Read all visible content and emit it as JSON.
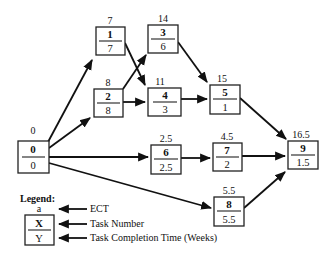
{
  "diagram": {
    "type": "activity-on-node network",
    "nodes": [
      {
        "id": "0",
        "task": "0",
        "ect": "0",
        "time": "0"
      },
      {
        "id": "1",
        "task": "1",
        "ect": "7",
        "time": "7"
      },
      {
        "id": "2",
        "task": "2",
        "ect": "8",
        "time": "8"
      },
      {
        "id": "3",
        "task": "3",
        "ect": "14",
        "time": "6"
      },
      {
        "id": "4",
        "task": "4",
        "ect": "11",
        "time": "3"
      },
      {
        "id": "5",
        "task": "5",
        "ect": "15",
        "time": "1"
      },
      {
        "id": "6",
        "task": "6",
        "ect": "2.5",
        "time": "2.5"
      },
      {
        "id": "7",
        "task": "7",
        "ect": "4.5",
        "time": "2"
      },
      {
        "id": "8",
        "task": "8",
        "ect": "5.5",
        "time": "5.5"
      },
      {
        "id": "9",
        "task": "9",
        "ect": "16.5",
        "time": "1.5"
      }
    ],
    "edges": [
      {
        "from": "0",
        "to": "1"
      },
      {
        "from": "0",
        "to": "2"
      },
      {
        "from": "0",
        "to": "6"
      },
      {
        "from": "0",
        "to": "8"
      },
      {
        "from": "1",
        "to": "4"
      },
      {
        "from": "2",
        "to": "3"
      },
      {
        "from": "2",
        "to": "4"
      },
      {
        "from": "3",
        "to": "5"
      },
      {
        "from": "4",
        "to": "5"
      },
      {
        "from": "5",
        "to": "9"
      },
      {
        "from": "6",
        "to": "7"
      },
      {
        "from": "7",
        "to": "9"
      },
      {
        "from": "8",
        "to": "9"
      }
    ]
  },
  "legend": {
    "title": "Legend:",
    "sample_ect": "a",
    "sample_task": "X",
    "sample_time": "Y",
    "ect_label": "ECT",
    "task_label": "Task Number",
    "time_label": "Task Completion Time (Weeks)"
  }
}
